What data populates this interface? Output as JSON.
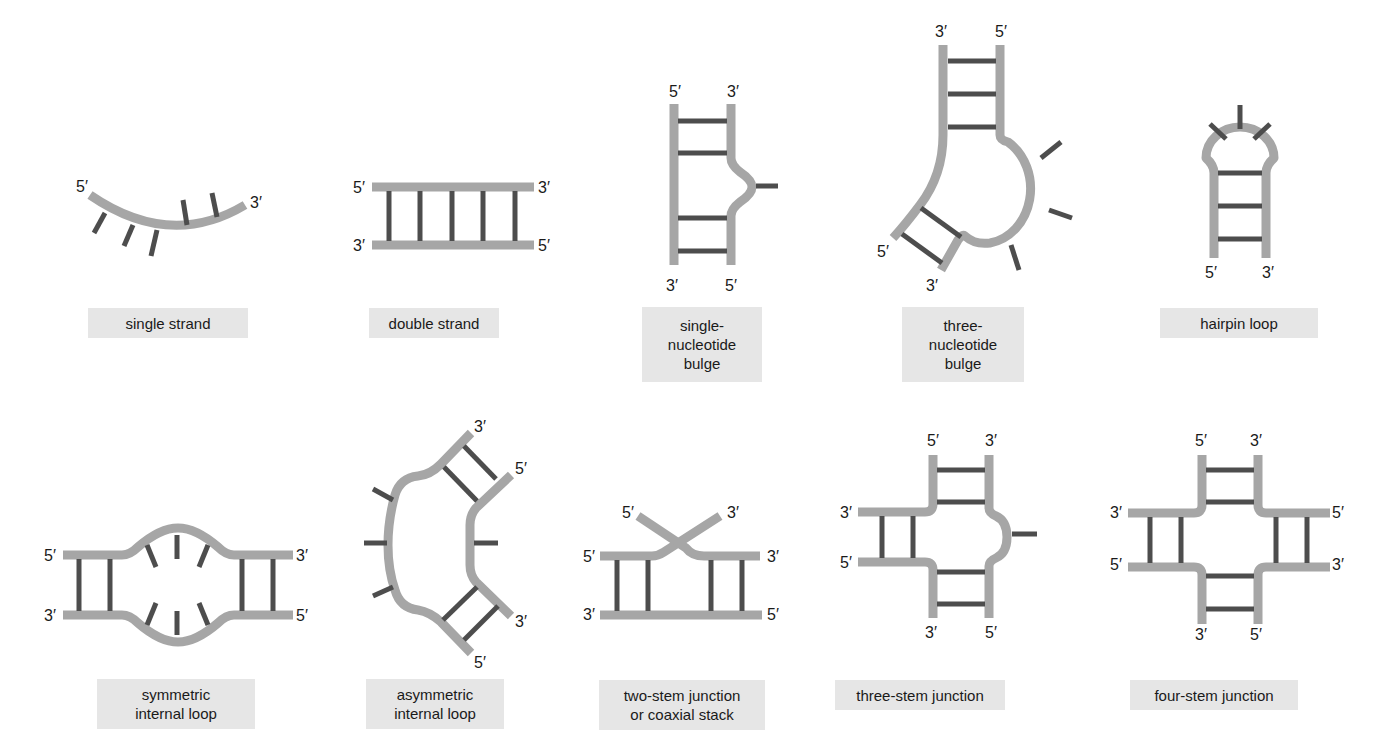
{
  "colors": {
    "backbone": "#a6a6a6",
    "base": "#4d4d4d",
    "caption_bg": "#e6e6e6",
    "text": "#1a1a1a"
  },
  "structures": [
    {
      "id": "single-strand",
      "caption": "single strand",
      "ends": [
        {
          "text": "5′",
          "x": 76,
          "y": 192
        },
        {
          "text": "3′",
          "x": 250,
          "y": 208
        }
      ]
    },
    {
      "id": "double-strand",
      "caption": "double strand",
      "ends": [
        {
          "text": "5′",
          "x": 353,
          "y": 193
        },
        {
          "text": "3′",
          "x": 538,
          "y": 193
        },
        {
          "text": "3′",
          "x": 353,
          "y": 251
        },
        {
          "text": "5′",
          "x": 538,
          "y": 251
        }
      ]
    },
    {
      "id": "single-nucleotide-bulge",
      "caption": "single-\nnucleotide\nbulge",
      "ends": [
        {
          "text": "5′",
          "x": 669,
          "y": 97
        },
        {
          "text": "3′",
          "x": 727,
          "y": 97
        },
        {
          "text": "3′",
          "x": 666,
          "y": 291
        },
        {
          "text": "5′",
          "x": 725,
          "y": 291
        }
      ]
    },
    {
      "id": "three-nucleotide-bulge",
      "caption": "three-\nnucleotide\nbulge",
      "ends": [
        {
          "text": "3′",
          "x": 935,
          "y": 37
        },
        {
          "text": "5′",
          "x": 995,
          "y": 37
        },
        {
          "text": "5′",
          "x": 877,
          "y": 257
        },
        {
          "text": "3′",
          "x": 926,
          "y": 291
        }
      ]
    },
    {
      "id": "hairpin-loop",
      "caption": "hairpin loop",
      "ends": [
        {
          "text": "5′",
          "x": 1205,
          "y": 278
        },
        {
          "text": "3′",
          "x": 1262,
          "y": 278
        }
      ]
    },
    {
      "id": "symmetric-internal-loop",
      "caption": "symmetric\ninternal loop",
      "ends": [
        {
          "text": "5′",
          "x": 44,
          "y": 561
        },
        {
          "text": "3′",
          "x": 296,
          "y": 561
        },
        {
          "text": "3′",
          "x": 44,
          "y": 621
        },
        {
          "text": "5′",
          "x": 296,
          "y": 621
        }
      ]
    },
    {
      "id": "asymmetric-internal-loop",
      "caption": "asymmetric\ninternal loop",
      "ends": [
        {
          "text": "3′",
          "x": 474,
          "y": 432
        },
        {
          "text": "5′",
          "x": 515,
          "y": 474
        },
        {
          "text": "3′",
          "x": 515,
          "y": 627
        },
        {
          "text": "5′",
          "x": 474,
          "y": 668
        }
      ]
    },
    {
      "id": "two-stem-junction",
      "caption": "two-stem junction\nor coaxial stack",
      "ends": [
        {
          "text": "5′",
          "x": 622,
          "y": 518
        },
        {
          "text": "3′",
          "x": 727,
          "y": 518
        },
        {
          "text": "5′",
          "x": 583,
          "y": 562
        },
        {
          "text": "3′",
          "x": 767,
          "y": 562
        },
        {
          "text": "3′",
          "x": 583,
          "y": 620
        },
        {
          "text": "5′",
          "x": 767,
          "y": 620
        }
      ]
    },
    {
      "id": "three-stem-junction",
      "caption": "three-stem junction",
      "ends": [
        {
          "text": "5′",
          "x": 927,
          "y": 446
        },
        {
          "text": "3′",
          "x": 985,
          "y": 446
        },
        {
          "text": "3′",
          "x": 840,
          "y": 518
        },
        {
          "text": "5′",
          "x": 840,
          "y": 568
        },
        {
          "text": "3′",
          "x": 925,
          "y": 638
        },
        {
          "text": "5′",
          "x": 985,
          "y": 638
        }
      ]
    },
    {
      "id": "four-stem-junction",
      "caption": "four-stem junction",
      "ends": [
        {
          "text": "5′",
          "x": 1195,
          "y": 446
        },
        {
          "text": "3′",
          "x": 1250,
          "y": 446
        },
        {
          "text": "3′",
          "x": 1110,
          "y": 518
        },
        {
          "text": "5′",
          "x": 1332,
          "y": 518
        },
        {
          "text": "5′",
          "x": 1110,
          "y": 570
        },
        {
          "text": "3′",
          "x": 1332,
          "y": 570
        },
        {
          "text": "3′",
          "x": 1195,
          "y": 640
        },
        {
          "text": "5′",
          "x": 1250,
          "y": 640
        }
      ]
    }
  ]
}
